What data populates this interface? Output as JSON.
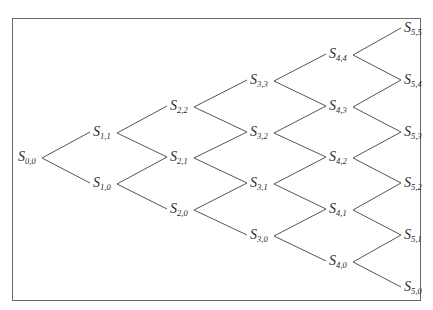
{
  "diagram": {
    "type": "binomial-tree",
    "steps": 5,
    "symbol": "S",
    "colors": {
      "line": "#555555",
      "text": "#2a2a2a",
      "border": "#6a6a6a",
      "background": "#ffffff"
    },
    "nodes": [
      {
        "id": "0,0",
        "label": "S",
        "sub": "0,0",
        "x": 18,
        "y": 158
      },
      {
        "id": "1,1",
        "label": "S",
        "sub": "1,1",
        "x": 93,
        "y": 133
      },
      {
        "id": "1,0",
        "label": "S",
        "sub": "1,0",
        "x": 93,
        "y": 184
      },
      {
        "id": "2,2",
        "label": "S",
        "sub": "2,2",
        "x": 170,
        "y": 107
      },
      {
        "id": "2,1",
        "label": "S",
        "sub": "2,1",
        "x": 170,
        "y": 158
      },
      {
        "id": "2,0",
        "label": "S",
        "sub": "2,0",
        "x": 170,
        "y": 210
      },
      {
        "id": "3,3",
        "label": "S",
        "sub": "3,3",
        "x": 250,
        "y": 81
      },
      {
        "id": "3,2",
        "label": "S",
        "sub": "3,2",
        "x": 250,
        "y": 133
      },
      {
        "id": "3,1",
        "label": "S",
        "sub": "3,1",
        "x": 250,
        "y": 184
      },
      {
        "id": "3,0",
        "label": "S",
        "sub": "3,0",
        "x": 250,
        "y": 236
      },
      {
        "id": "4,4",
        "label": "S",
        "sub": "4,4",
        "x": 329,
        "y": 55
      },
      {
        "id": "4,3",
        "label": "S",
        "sub": "4,3",
        "x": 329,
        "y": 107
      },
      {
        "id": "4,2",
        "label": "S",
        "sub": "4,2",
        "x": 329,
        "y": 158
      },
      {
        "id": "4,1",
        "label": "S",
        "sub": "4,1",
        "x": 329,
        "y": 210
      },
      {
        "id": "4,0",
        "label": "S",
        "sub": "4,0",
        "x": 329,
        "y": 262
      },
      {
        "id": "5,5",
        "label": "S",
        "sub": "5,5",
        "x": 404,
        "y": 29
      },
      {
        "id": "5,4",
        "label": "S",
        "sub": "5,4",
        "x": 404,
        "y": 81
      },
      {
        "id": "5,3",
        "label": "S",
        "sub": "5,3",
        "x": 404,
        "y": 133
      },
      {
        "id": "5,2",
        "label": "S",
        "sub": "5,2",
        "x": 404,
        "y": 184
      },
      {
        "id": "5,1",
        "label": "S",
        "sub": "5,1",
        "x": 404,
        "y": 236
      },
      {
        "id": "5,0",
        "label": "S",
        "sub": "5,0",
        "x": 404,
        "y": 288
      }
    ]
  }
}
